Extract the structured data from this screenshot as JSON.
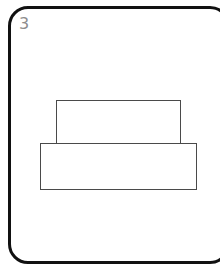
{
  "panel": {
    "number": "3",
    "number_color": "#8d8d8d",
    "frame_color": "#111111",
    "background_color": "#ffffff"
  },
  "figure": {
    "stroke_color": "#4a4a4a",
    "fill_color": "#ffffff",
    "shapes": [
      {
        "name": "upper-rectangle",
        "type": "rectangle",
        "x": 56,
        "y": 100,
        "width": 125,
        "height": 44
      },
      {
        "name": "lower-rectangle",
        "type": "rectangle",
        "x": 40,
        "y": 143,
        "width": 157,
        "height": 47
      }
    ]
  }
}
